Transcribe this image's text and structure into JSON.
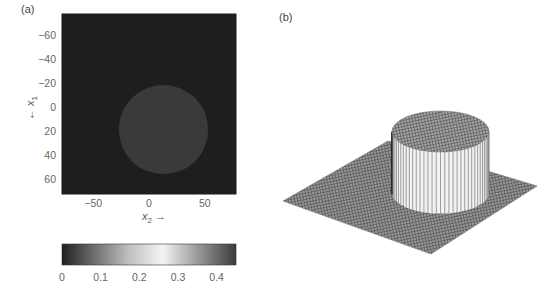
{
  "panels": {
    "a_label": "(a)",
    "b_label": "(b)"
  },
  "chart_data": [
    {
      "type": "heatmap",
      "panel": "(a)",
      "title": "",
      "xlabel": "x₂ →",
      "ylabel": "← x₁",
      "xlabel_main": "x",
      "xlabel_sub": "2",
      "xlabel_arrow": "→",
      "ylabel_arrow": "←",
      "ylabel_main": "x",
      "ylabel_sub": "1",
      "xlim": [
        -78,
        78
      ],
      "ylim": [
        -78,
        73
      ],
      "y_inverted": true,
      "xticks": [
        -50,
        0,
        50
      ],
      "xtick_labels": [
        "−50",
        "0",
        "50"
      ],
      "yticks": [
        -60,
        -40,
        -20,
        0,
        20,
        40,
        60
      ],
      "ytick_labels": [
        "−60",
        "−40",
        "−20",
        "0",
        "20",
        "40",
        "60"
      ],
      "background_value": 0.02,
      "disk": {
        "center_x2": 13,
        "center_x1": 19,
        "radius": 40,
        "value": 0.05
      },
      "colors": {
        "background": "#1e1e1e",
        "disk": "#3a3a3a"
      },
      "colorbar": {
        "orientation": "horizontal",
        "placement": "bottom",
        "range": [
          0,
          0.45
        ],
        "ticks": [
          0,
          0.1,
          0.2,
          0.3,
          0.4
        ],
        "tick_labels": [
          "0",
          "0.1",
          "0.2",
          "0.3",
          "0.4"
        ],
        "stops": [
          {
            "value": 0.0,
            "color": "#202020"
          },
          {
            "value": 0.08,
            "color": "#6a6a6a"
          },
          {
            "value": 0.17,
            "color": "#bdbdbd"
          },
          {
            "value": 0.26,
            "color": "#f4f4f4"
          },
          {
            "value": 0.35,
            "color": "#9a9a9a"
          },
          {
            "value": 0.45,
            "color": "#3c3c3c"
          }
        ]
      }
    },
    {
      "type": "surface",
      "panel": "(b)",
      "title": "",
      "description": "3-D mesh surface of the same image: flat plane with a raised cylindrical disk",
      "plane_value": 0,
      "disk_height": 1,
      "colors": {
        "mesh": "#8a8a8a",
        "wall_light": "#f2f2f2",
        "wall_dark": "#777777"
      }
    }
  ]
}
